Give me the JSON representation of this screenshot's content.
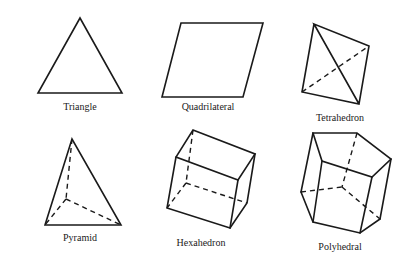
{
  "figure": {
    "shapes": [
      {
        "id": "triangle",
        "label": "Triangle"
      },
      {
        "id": "quadrilateral",
        "label": "Quadrilateral"
      },
      {
        "id": "tetrahedron",
        "label": "Tetrahedron"
      },
      {
        "id": "pyramid",
        "label": "Pyramid"
      },
      {
        "id": "hexahedron",
        "label": "Hexahedron"
      },
      {
        "id": "polyhedral",
        "label": "Polyhedral"
      }
    ],
    "colors": {
      "stroke": "#1a1a1a",
      "background": "#ffffff"
    }
  }
}
